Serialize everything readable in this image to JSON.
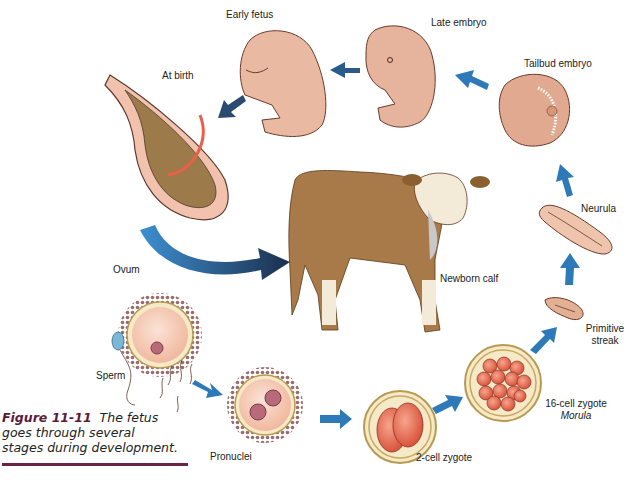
{
  "figure": {
    "number": "Figure 11-11",
    "caption": "The fetus goes through several stages during development.",
    "caption_lines": [
      "The fetus",
      "goes through several",
      "stages during development."
    ]
  },
  "stages": [
    {
      "id": "ovum",
      "label": "Ovum"
    },
    {
      "id": "sperm",
      "label": "Sperm"
    },
    {
      "id": "pronuclei",
      "label": "Pronuclei"
    },
    {
      "id": "two-cell",
      "label": "2-cell zygote"
    },
    {
      "id": "sixteen-cell",
      "label": "16-cell zygote",
      "sublabel": "Morula"
    },
    {
      "id": "primitive-streak",
      "label": "Primitive",
      "label2": "streak"
    },
    {
      "id": "neurula",
      "label": "Neurula"
    },
    {
      "id": "tailbud",
      "label": "Tailbud embryo"
    },
    {
      "id": "late-embryo",
      "label": "Late embryo"
    },
    {
      "id": "early-fetus",
      "label": "Early fetus"
    },
    {
      "id": "at-birth",
      "label": "At birth"
    },
    {
      "id": "newborn-calf",
      "label": "Newborn calf"
    }
  ],
  "colors": {
    "arrow_blue": "#2e7ab8",
    "arrow_dark": "#1f3a5c",
    "embryo_skin": "#e8b8a0",
    "calf_brown": "#a87a4a",
    "cell_orange": "#e86a50",
    "caption_accent": "#6b2248"
  }
}
